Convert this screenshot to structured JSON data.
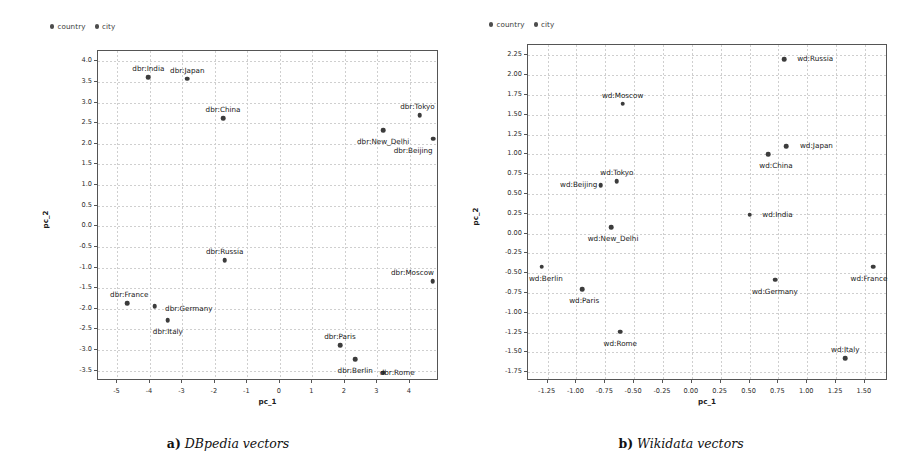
{
  "figure": {
    "panels": [
      {
        "id": "a",
        "caption_tag": "a)",
        "caption_text": "DBpedia vectors",
        "legend": [
          {
            "label": "country",
            "marker": "filled-circle",
            "color": "#4d4d4d"
          },
          {
            "label": "city",
            "marker": "filled-circle",
            "color": "#4d4d4d"
          }
        ],
        "chart_data": {
          "type": "scatter",
          "title": "",
          "xlabel": "pc_1",
          "ylabel": "pc_2",
          "xlim": [
            -5.6,
            4.9
          ],
          "ylim": [
            -3.75,
            4.25
          ],
          "xticks": [
            -5,
            -4,
            -3,
            -2,
            -1,
            0,
            1,
            2,
            3,
            4
          ],
          "yticks": [
            -3.5,
            -3.0,
            -2.5,
            -2.0,
            -1.5,
            -1.0,
            -0.5,
            0.0,
            0.5,
            1.0,
            1.5,
            2.0,
            2.5,
            3.0,
            3.5,
            4.0
          ],
          "xticklabels": [
            "-5",
            "-4",
            "-3",
            "-2",
            "-1",
            "0",
            "1",
            "2",
            "3",
            "4"
          ],
          "yticklabels": [
            "-3.5",
            "-3.0",
            "-2.5",
            "-2.0",
            "-1.5",
            "-1.0",
            "-0.5",
            "0.0",
            "0.5",
            "1.0",
            "1.5",
            "2.0",
            "2.5",
            "3.0",
            "3.5",
            "4.0"
          ],
          "grid": true,
          "legend_position": "above-left",
          "series": [
            {
              "name": "country",
              "points": [
                {
                  "label": "dbr:India",
                  "x": -4.05,
                  "y": 3.62,
                  "label_dx": 0,
                  "label_dy": -9
                },
                {
                  "label": "dbr:Japan",
                  "x": -2.85,
                  "y": 3.58,
                  "label_dx": 0,
                  "label_dy": -9
                },
                {
                  "label": "dbr:China",
                  "x": -1.75,
                  "y": 2.62,
                  "label_dx": 0,
                  "label_dy": -9
                },
                {
                  "label": "dbr:Russia",
                  "x": -1.7,
                  "y": -0.82,
                  "label_dx": 0,
                  "label_dy": -9
                },
                {
                  "label": "dbr:France",
                  "x": -4.7,
                  "y": -1.87,
                  "label_dx": 2,
                  "label_dy": -9
                },
                {
                  "label": "dbr:Germany",
                  "x": -3.85,
                  "y": -1.93,
                  "label_dx": 34,
                  "label_dy": 2
                },
                {
                  "label": "dbr:Italy",
                  "x": -3.45,
                  "y": -2.28,
                  "label_dx": 0,
                  "label_dy": 11
                }
              ]
            },
            {
              "name": "city",
              "points": [
                {
                  "label": "dbr:Tokyo",
                  "x": 4.3,
                  "y": 2.7,
                  "label_dx": -2,
                  "label_dy": -9
                },
                {
                  "label": "dbr:New_Delhi",
                  "x": 3.18,
                  "y": 2.33,
                  "label_dx": 0,
                  "label_dy": 11
                },
                {
                  "label": "dbr:Beijing",
                  "x": 4.72,
                  "y": 2.12,
                  "label_dx": -20,
                  "label_dy": 11
                },
                {
                  "label": "dbr:Moscow",
                  "x": 4.7,
                  "y": -1.33,
                  "label_dx": -20,
                  "label_dy": -9
                },
                {
                  "label": "dbr:Paris",
                  "x": 1.85,
                  "y": -2.88,
                  "label_dx": 0,
                  "label_dy": -9
                },
                {
                  "label": "dbr:Berlin",
                  "x": 2.32,
                  "y": -3.22,
                  "label_dx": 0,
                  "label_dy": 11
                },
                {
                  "label": "dbr:Rome",
                  "x": 3.18,
                  "y": -3.55,
                  "label_dx": 14,
                  "label_dy": -1
                }
              ]
            }
          ]
        }
      },
      {
        "id": "b",
        "caption_tag": "b)",
        "caption_text": "Wikidata vectors",
        "legend": [
          {
            "label": "country",
            "marker": "filled-circle",
            "color": "#4d4d4d"
          },
          {
            "label": "city",
            "marker": "filled-circle",
            "color": "#4d4d4d"
          }
        ],
        "chart_data": {
          "type": "scatter",
          "title": "",
          "xlabel": "pc_1",
          "ylabel": "pc_2",
          "xlim": [
            -1.42,
            1.7
          ],
          "ylim": [
            -1.86,
            2.38
          ],
          "xticks": [
            -1.25,
            -1.0,
            -0.75,
            -0.5,
            -0.25,
            0.0,
            0.25,
            0.5,
            0.75,
            1.0,
            1.25,
            1.5
          ],
          "yticks": [
            -1.75,
            -1.5,
            -1.25,
            -1.0,
            -0.75,
            -0.5,
            -0.25,
            0.0,
            0.25,
            0.5,
            0.75,
            1.0,
            1.25,
            1.5,
            1.75,
            2.0,
            2.25
          ],
          "xticklabels": [
            "-1.25",
            "-1.00",
            "-0.75",
            "-0.50",
            "-0.25",
            "0.00",
            "0.25",
            "0.50",
            "0.75",
            "1.00",
            "1.25",
            "1.50"
          ],
          "yticklabels": [
            "-1.75",
            "-1.50",
            "-1.25",
            "-1.00",
            "-0.75",
            "-0.50",
            "-0.25",
            "0.00",
            "0.25",
            "0.50",
            "0.75",
            "1.00",
            "1.25",
            "1.50",
            "1.75",
            "2.00",
            "2.25"
          ],
          "grid": true,
          "legend_position": "above-left",
          "series": [
            {
              "name": "country",
              "points": [
                {
                  "label": "wd:Russia",
                  "x": 0.8,
                  "y": 2.2,
                  "label_dx": 31,
                  "label_dy": -1
                },
                {
                  "label": "wd:Japan",
                  "x": 0.82,
                  "y": 1.1,
                  "label_dx": 30,
                  "label_dy": -1
                },
                {
                  "label": "wd:China",
                  "x": 0.66,
                  "y": 1.0,
                  "label_dx": 8,
                  "label_dy": 11
                },
                {
                  "label": "wd:India",
                  "x": 0.5,
                  "y": 0.24,
                  "label_dx": 28,
                  "label_dy": -1
                },
                {
                  "label": "wd:Germany",
                  "x": 0.72,
                  "y": -0.58,
                  "label_dx": 0,
                  "label_dy": 11
                },
                {
                  "label": "wd:France",
                  "x": 1.57,
                  "y": -0.42,
                  "label_dx": -4,
                  "label_dy": 11
                },
                {
                  "label": "wd:Italy",
                  "x": 1.33,
                  "y": -1.57,
                  "label_dx": 0,
                  "label_dy": -9
                }
              ]
            },
            {
              "name": "city",
              "points": [
                {
                  "label": "wd:Moscow",
                  "x": -0.6,
                  "y": 1.64,
                  "label_dx": 0,
                  "label_dy": -9
                },
                {
                  "label": "wd:Tokyo",
                  "x": -0.65,
                  "y": 0.66,
                  "label_dx": 0,
                  "label_dy": -9
                },
                {
                  "label": "wd:Beijing",
                  "x": -0.79,
                  "y": 0.61,
                  "label_dx": -22,
                  "label_dy": -1
                },
                {
                  "label": "wd:New_Delhi",
                  "x": -0.7,
                  "y": 0.08,
                  "label_dx": 2,
                  "label_dy": 11
                },
                {
                  "label": "wd:Berlin",
                  "x": -1.3,
                  "y": -0.42,
                  "label_dx": 4,
                  "label_dy": 11
                },
                {
                  "label": "wd:Paris",
                  "x": -0.95,
                  "y": -0.7,
                  "label_dx": 2,
                  "label_dy": 11
                },
                {
                  "label": "wd:Rome",
                  "x": -0.62,
                  "y": -1.24,
                  "label_dx": 0,
                  "label_dy": 11
                }
              ]
            }
          ]
        }
      }
    ]
  }
}
